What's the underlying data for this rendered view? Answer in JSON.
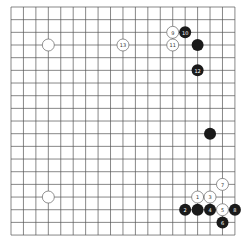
{
  "board": {
    "size": 19,
    "origin_x": 11,
    "origin_y": 7,
    "spacing_x": 12.44,
    "spacing_y": 12.67,
    "stone_radius": 6,
    "colors": {
      "line": "#555555",
      "black": "#1a1a1a",
      "white": "#ffffff"
    }
  },
  "stones": [
    {
      "color": "white",
      "col": 3,
      "row": 3,
      "label": ""
    },
    {
      "color": "white",
      "col": 9,
      "row": 3,
      "label": "13"
    },
    {
      "color": "white",
      "col": 13,
      "row": 2,
      "label": "9"
    },
    {
      "color": "black",
      "col": 14,
      "row": 2,
      "label": "10"
    },
    {
      "color": "white",
      "col": 13,
      "row": 3,
      "label": "11"
    },
    {
      "color": "black",
      "col": 15,
      "row": 3,
      "label": ""
    },
    {
      "color": "black",
      "col": 15,
      "row": 5,
      "label": "12"
    },
    {
      "color": "black",
      "col": 16,
      "row": 10,
      "label": ""
    },
    {
      "color": "white",
      "col": 3,
      "row": 15,
      "label": ""
    },
    {
      "color": "white",
      "col": 17,
      "row": 14,
      "label": "7"
    },
    {
      "color": "white",
      "col": 15,
      "row": 15,
      "label": "1"
    },
    {
      "color": "white",
      "col": 16,
      "row": 15,
      "label": "3"
    },
    {
      "color": "black",
      "col": 14,
      "row": 16,
      "label": "2"
    },
    {
      "color": "black",
      "col": 15,
      "row": 16,
      "label": ""
    },
    {
      "color": "black",
      "col": 16,
      "row": 16,
      "label": "4"
    },
    {
      "color": "white",
      "col": 17,
      "row": 16,
      "label": "5"
    },
    {
      "color": "black",
      "col": 18,
      "row": 16,
      "label": "8"
    },
    {
      "color": "black",
      "col": 17,
      "row": 17,
      "label": "6"
    }
  ]
}
